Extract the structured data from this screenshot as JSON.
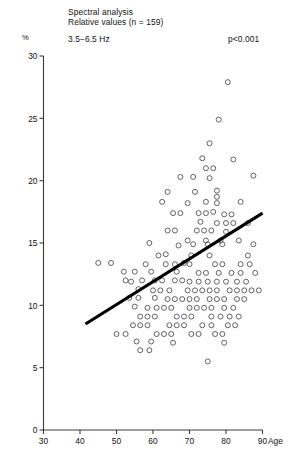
{
  "figure": {
    "title_line1": "Spectral analysis",
    "title_line2": "Relative values (n = 159)",
    "band_label": "3.5−6.5 Hz",
    "pvalue": "p<0.001",
    "unit_label": "%",
    "xaxis_name": "Age"
  },
  "chart_data": {
    "type": "scatter",
    "title": "Spectral analysis",
    "subtitle": "Relative values (n = 159)",
    "annotations": [
      "3.5−6.5 Hz",
      "p<0.001"
    ],
    "xlabel": "Age",
    "ylabel": "%",
    "xlim": [
      30,
      90
    ],
    "ylim": [
      0,
      30
    ],
    "xticks": [
      30,
      40,
      50,
      60,
      70,
      80,
      90
    ],
    "yticks": [
      0,
      5,
      10,
      15,
      20,
      25,
      30
    ],
    "xtick_labels": [
      "30",
      "40",
      "50",
      "60",
      "70",
      "80",
      "90"
    ],
    "ytick_labels": [
      "0",
      "5",
      "10",
      "15",
      "20",
      "25",
      "30"
    ],
    "grid": false,
    "legend": null,
    "n": 159,
    "marker": "open-circle",
    "trendline": {
      "type": "linear-regression",
      "x_start": 41.5,
      "y_start": 8.5,
      "x_end": 90.0,
      "y_end": 17.4
    },
    "points": [
      [
        80.5,
        27.9
      ],
      [
        78.0,
        24.9
      ],
      [
        75.5,
        23.0
      ],
      [
        73.5,
        21.8
      ],
      [
        82.0,
        21.7
      ],
      [
        74.5,
        21.0
      ],
      [
        76.5,
        21.0
      ],
      [
        75.5,
        20.2
      ],
      [
        77.5,
        19.2
      ],
      [
        64.0,
        19.1
      ],
      [
        71.5,
        19.1
      ],
      [
        77.5,
        18.7
      ],
      [
        87.5,
        20.4
      ],
      [
        62.5,
        18.3
      ],
      [
        69.5,
        18.2
      ],
      [
        74.5,
        18.3
      ],
      [
        77.5,
        18.2
      ],
      [
        65.5,
        17.4
      ],
      [
        67.5,
        17.4
      ],
      [
        72.5,
        17.4
      ],
      [
        74.5,
        17.4
      ],
      [
        76.5,
        17.5
      ],
      [
        79.5,
        17.3
      ],
      [
        81.5,
        17.3
      ],
      [
        73.0,
        16.7
      ],
      [
        77.5,
        16.6
      ],
      [
        80.0,
        16.6
      ],
      [
        82.0,
        16.6
      ],
      [
        64.0,
        16.0
      ],
      [
        66.0,
        16.0
      ],
      [
        72.0,
        16.0
      ],
      [
        74.0,
        16.0
      ],
      [
        76.0,
        16.0
      ],
      [
        80.0,
        15.9
      ],
      [
        74.5,
        15.2
      ],
      [
        78.5,
        15.2
      ],
      [
        83.5,
        15.2
      ],
      [
        59.0,
        15.0
      ],
      [
        67.0,
        14.8
      ],
      [
        71.0,
        14.9
      ],
      [
        75.0,
        14.9
      ],
      [
        79.0,
        14.9
      ],
      [
        87.5,
        14.9
      ],
      [
        63.5,
        14.1
      ],
      [
        70.5,
        14.0
      ],
      [
        75.5,
        14.0
      ],
      [
        86.0,
        14.0
      ],
      [
        45.0,
        13.4
      ],
      [
        48.5,
        13.4
      ],
      [
        63.5,
        13.3
      ],
      [
        66.0,
        13.3
      ],
      [
        68.5,
        13.4
      ],
      [
        70.0,
        13.3
      ],
      [
        77.0,
        13.3
      ],
      [
        79.0,
        13.3
      ],
      [
        84.0,
        13.3
      ],
      [
        52.0,
        12.7
      ],
      [
        55.0,
        12.7
      ],
      [
        59.5,
        12.7
      ],
      [
        66.5,
        12.7
      ],
      [
        72.5,
        12.6
      ],
      [
        74.5,
        12.6
      ],
      [
        78.0,
        12.6
      ],
      [
        81.5,
        12.6
      ],
      [
        84.0,
        12.6
      ],
      [
        52.5,
        12.0
      ],
      [
        57.0,
        12.0
      ],
      [
        60.5,
        12.0
      ],
      [
        62.5,
        12.0
      ],
      [
        70.0,
        11.9
      ],
      [
        72.5,
        11.9
      ],
      [
        75.0,
        11.9
      ],
      [
        77.5,
        11.9
      ],
      [
        80.0,
        11.9
      ],
      [
        83.0,
        11.9
      ],
      [
        85.5,
        11.9
      ],
      [
        56.0,
        11.3
      ],
      [
        60.0,
        11.2
      ],
      [
        62.0,
        11.2
      ],
      [
        64.5,
        11.2
      ],
      [
        69.5,
        11.2
      ],
      [
        71.5,
        11.2
      ],
      [
        73.5,
        11.2
      ],
      [
        75.5,
        11.2
      ],
      [
        77.5,
        11.2
      ],
      [
        81.0,
        11.2
      ],
      [
        83.0,
        11.2
      ],
      [
        85.0,
        11.2
      ],
      [
        87.0,
        11.2
      ],
      [
        89.0,
        11.2
      ],
      [
        53.5,
        10.6
      ],
      [
        56.0,
        10.6
      ],
      [
        60.5,
        10.6
      ],
      [
        64.0,
        10.5
      ],
      [
        66.0,
        10.5
      ],
      [
        68.0,
        10.5
      ],
      [
        70.0,
        10.5
      ],
      [
        72.0,
        10.5
      ],
      [
        75.5,
        10.5
      ],
      [
        77.5,
        10.5
      ],
      [
        79.5,
        10.5
      ],
      [
        83.0,
        10.5
      ],
      [
        85.0,
        10.5
      ],
      [
        55.0,
        9.9
      ],
      [
        58.5,
        9.8
      ],
      [
        61.0,
        9.8
      ],
      [
        63.0,
        9.8
      ],
      [
        65.0,
        9.8
      ],
      [
        70.0,
        9.8
      ],
      [
        72.0,
        9.8
      ],
      [
        74.0,
        9.8
      ],
      [
        76.0,
        9.8
      ],
      [
        79.5,
        9.8
      ],
      [
        82.0,
        9.8
      ],
      [
        56.5,
        9.1
      ],
      [
        58.5,
        9.1
      ],
      [
        60.5,
        9.1
      ],
      [
        66.5,
        9.1
      ],
      [
        68.5,
        9.1
      ],
      [
        70.5,
        9.1
      ],
      [
        76.0,
        9.1
      ],
      [
        78.5,
        9.1
      ],
      [
        81.0,
        9.1
      ],
      [
        83.5,
        9.1
      ],
      [
        54.5,
        8.4
      ],
      [
        56.5,
        8.4
      ],
      [
        58.5,
        8.4
      ],
      [
        64.5,
        8.4
      ],
      [
        66.5,
        8.4
      ],
      [
        68.5,
        8.4
      ],
      [
        73.5,
        8.4
      ],
      [
        76.0,
        8.4
      ],
      [
        80.5,
        8.4
      ],
      [
        82.5,
        8.4
      ],
      [
        50.0,
        7.7
      ],
      [
        52.5,
        7.7
      ],
      [
        61.0,
        7.7
      ],
      [
        63.0,
        7.7
      ],
      [
        65.0,
        7.7
      ],
      [
        70.5,
        7.7
      ],
      [
        72.5,
        7.7
      ],
      [
        77.0,
        7.7
      ],
      [
        79.0,
        7.7
      ],
      [
        55.5,
        7.1
      ],
      [
        59.5,
        7.1
      ],
      [
        65.5,
        7.0
      ],
      [
        79.5,
        7.0
      ],
      [
        56.5,
        6.4
      ],
      [
        59.0,
        6.4
      ],
      [
        75.0,
        5.5
      ],
      [
        86.0,
        16.6
      ],
      [
        84.0,
        18.3
      ],
      [
        67.5,
        20.3
      ],
      [
        69.5,
        15.2
      ],
      [
        71.0,
        20.3
      ],
      [
        86.5,
        13.3
      ],
      [
        88.0,
        12.6
      ],
      [
        66.0,
        12.0
      ],
      [
        68.0,
        12.0
      ],
      [
        54.0,
        11.9
      ],
      [
        58.0,
        13.3
      ],
      [
        61.5,
        14.0
      ]
    ]
  }
}
